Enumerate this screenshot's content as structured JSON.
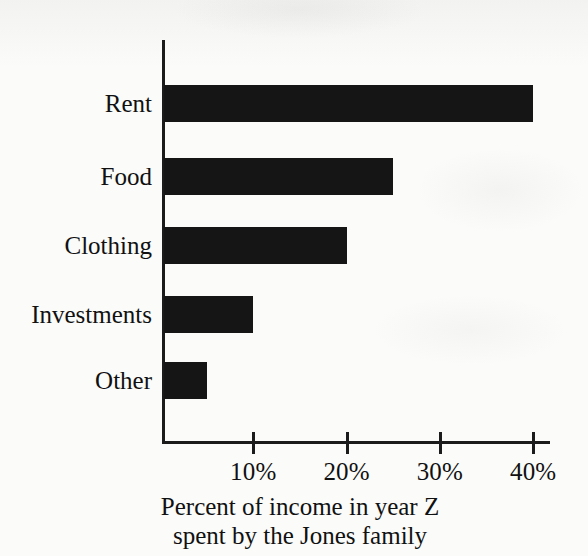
{
  "chart_data": {
    "type": "bar",
    "orientation": "horizontal",
    "title": "",
    "subtitle": "",
    "categories": [
      "Rent",
      "Food",
      "Clothing",
      "Investments",
      "Other"
    ],
    "values": [
      40,
      25,
      20,
      10,
      5
    ],
    "xlabel": "Percent of income in year Z spent by the Jones family",
    "ylabel": "",
    "xlim": [
      0,
      42
    ],
    "xticks": [
      10,
      20,
      30,
      40
    ],
    "xtick_labels": [
      "10%",
      "20%",
      "30%",
      "40%"
    ],
    "grid": false,
    "legend": null,
    "bar_color": "#151515",
    "axis_color": "#1b1b1b",
    "background_color": "#fbfbfa",
    "units": "percent"
  },
  "caption": {
    "line1": "Percent of income in year Z",
    "line2": "spent by the Jones family"
  }
}
